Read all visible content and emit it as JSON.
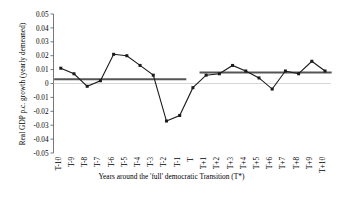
{
  "chart_data": {
    "type": "line",
    "title": "",
    "xlabel": "Years around the 'full' democratic Transition (T*)",
    "ylabel": "Real GDP p.c. growth (yearly demeaned)",
    "ylim": [
      -0.05,
      0.05
    ],
    "ytick_labels": [
      "0.05",
      "0.04",
      "0.03",
      "0.02",
      "0.01",
      "0",
      "-0.01",
      "-0.02",
      "-0.03",
      "-0.04",
      "-0.05"
    ],
    "ytick_values": [
      0.05,
      0.04,
      0.03,
      0.02,
      0.01,
      0,
      -0.01,
      -0.02,
      -0.03,
      -0.04,
      -0.05
    ],
    "grid": false,
    "legend": "none",
    "categories": [
      "T-10",
      "T-9",
      "T-8",
      "T-7",
      "T-6",
      "T-5",
      "T-4",
      "T-3",
      "T-2",
      "T-1",
      "T",
      "T+1",
      "T+2",
      "T+3",
      "T+4",
      "T+5",
      "T+6",
      "T+7",
      "T+8",
      "T+9",
      "T+10"
    ],
    "series": [
      {
        "name": "Real GDP p.c. growth (yearly demeaned)",
        "marker": "square",
        "color": "#1a1a1a",
        "values": [
          0.011,
          0.007,
          -0.002,
          0.002,
          0.021,
          0.02,
          0.013,
          0.006,
          -0.027,
          -0.023,
          -0.003,
          0.006,
          0.007,
          0.013,
          0.009,
          0.004,
          -0.004,
          0.009,
          0.007,
          0.016,
          0.009
        ]
      }
    ],
    "mean_lines": [
      {
        "name": "pre-transition-mean",
        "color": "#555555",
        "value": 0.003,
        "x_from": "T-10",
        "x_to": "T-1"
      },
      {
        "name": "post-transition-mean",
        "color": "#555555",
        "value": 0.008,
        "x_from": "T+1",
        "x_to": "T+10"
      }
    ]
  }
}
